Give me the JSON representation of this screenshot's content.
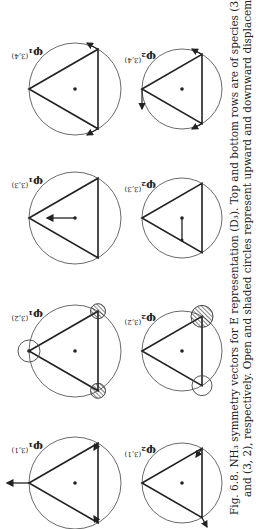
{
  "figure": {
    "number": "Fig. 6.8.",
    "caption_line1": "Fig. 6.8.   NH₃ symmetry vectors for E representation (D₃).   Top and bottom rows are of species (3, 1)",
    "caption_line2": "and (3, 2), respectively.   Open and shaded circles represent upward and downward displacements.",
    "panels": [
      {
        "row": "top",
        "label": "φ₁",
        "species": "(3,1)",
        "content": "up arrow on apex, inward arrows at base vertices"
      },
      {
        "row": "top",
        "label": "φ₁",
        "species": "(3,2)",
        "content": "open circle at apex, shaded circles at base vertices"
      },
      {
        "row": "top",
        "label": "φ₁",
        "species": "(3,3)",
        "content": "arrow from center toward apex"
      },
      {
        "row": "top",
        "label": "φ₁",
        "species": "(3,4)",
        "content": "tangential arrows at base vertices"
      },
      {
        "row": "bottom",
        "label": "φ₂",
        "species": "(3,1)",
        "content": "outward arrow at left base, inward arrow at right base"
      },
      {
        "row": "bottom",
        "label": "φ₂",
        "species": "(3,2)",
        "content": "open circle at left base, shaded circle at right base"
      },
      {
        "row": "bottom",
        "label": "φ₂",
        "species": "(3,3)",
        "content": "arrow from center to left"
      },
      {
        "row": "bottom",
        "label": "φ₂",
        "species": "(3,4)",
        "content": "tangential arrows at all vertices"
      }
    ],
    "labels": {
      "t1": "φ₁",
      "t1s": "(3,1)",
      "t2": "φ₁",
      "t2s": "(3,2)",
      "t3": "φ₁",
      "t3s": "(3,3)",
      "t4": "φ₁",
      "t4s": "(3,4)",
      "b1": "φ₂",
      "b1s": "(3,1)",
      "b2": "φ₂",
      "b2s": "(3,2)",
      "b3": "φ₂",
      "b3s": "(3,3)",
      "b4": "φ₂",
      "b4s": "(3,4)"
    }
  }
}
